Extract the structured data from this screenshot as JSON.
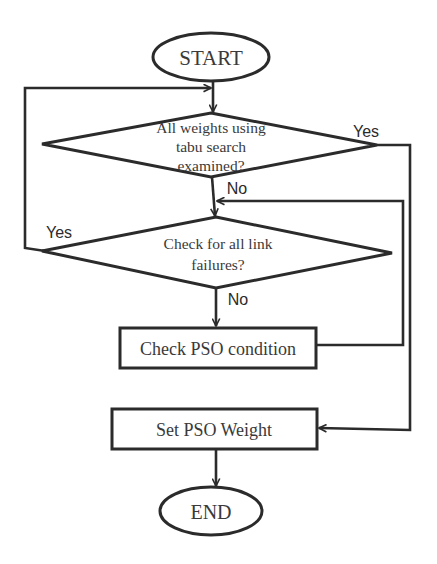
{
  "diagram": {
    "type": "flowchart",
    "nodes": {
      "start": {
        "label": "START",
        "shape": "ellipse"
      },
      "decision1": {
        "lines": [
          "All weights using",
          "tabu search",
          "examined?"
        ],
        "shape": "diamond"
      },
      "decision2": {
        "lines": [
          "Check for all link",
          "failures?"
        ],
        "shape": "diamond"
      },
      "process1": {
        "label": "Check PSO condition",
        "shape": "rectangle"
      },
      "process2": {
        "label": "Set PSO Weight",
        "shape": "rectangle"
      },
      "end": {
        "label": "END",
        "shape": "ellipse"
      }
    },
    "edge_labels": {
      "d1_yes": "Yes",
      "d1_no": "No",
      "d2_yes": "Yes",
      "d2_no": "No"
    },
    "edges": [
      {
        "from": "start",
        "to": "decision1"
      },
      {
        "from": "decision1",
        "to": "decision2",
        "label": "No"
      },
      {
        "from": "decision1",
        "to": "process2",
        "label": "Yes"
      },
      {
        "from": "decision2",
        "to": "process1",
        "label": "No"
      },
      {
        "from": "decision2",
        "to": "decision1",
        "label": "Yes"
      },
      {
        "from": "process1",
        "to": "decision2"
      },
      {
        "from": "process2",
        "to": "end"
      }
    ],
    "colors": {
      "stroke": "#2b2b2b",
      "text": "#3a3a3a",
      "background": "#ffffff"
    }
  }
}
